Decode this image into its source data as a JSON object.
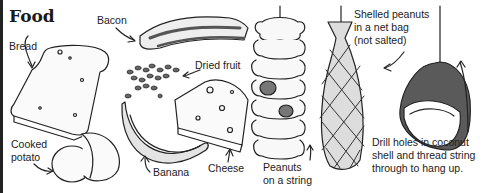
{
  "title": "Food",
  "labels": {
    "bread": "Bread",
    "bacon": "Bacon",
    "dried_fruit": "Dried fruit",
    "cooked_potato_1": "Cooked",
    "cooked_potato_2": "potato",
    "banana": "Banana",
    "cheese": "Cheese",
    "peanuts_string_1": "Peanuts",
    "peanuts_string_2": "on a string",
    "net_bag_1": "Shelled peanuts",
    "net_bag_2": "in a net bag",
    "net_bag_3": "(not salted)",
    "coconut_1": "Drill holes in coconut",
    "coconut_2": "shell and thread string",
    "coconut_3": "through to hang up."
  },
  "colors": {
    "ink": "#222222",
    "shade": "#6e6e6e",
    "light_shade": "#cfcfcf"
  }
}
